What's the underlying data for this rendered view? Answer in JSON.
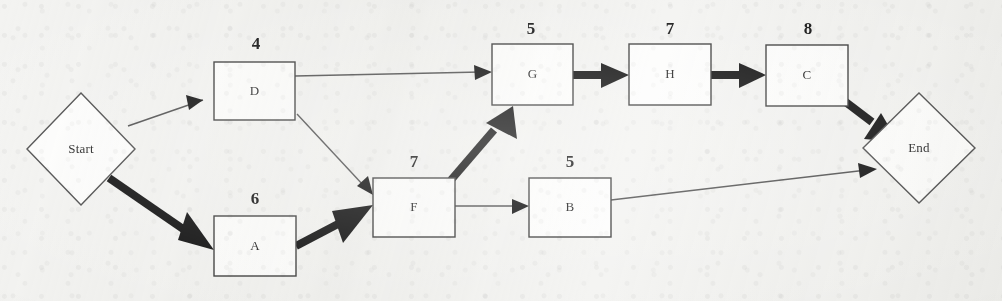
{
  "diagram": {
    "type": "activity-on-node-network",
    "background_color": "#f3f3f1",
    "line_color": "#4d4d4d",
    "critical_color": "#0d0d0d",
    "node_fill": "#fdfdfc"
  },
  "nodes": [
    {
      "id": "start",
      "label": "Start",
      "shape": "diamond",
      "weight": "",
      "cx": 81,
      "cy": 149,
      "rx": 54,
      "ry": 56
    },
    {
      "id": "d",
      "label": "D",
      "shape": "rect",
      "weight": "4",
      "x": 214,
      "y": 62,
      "w": 81,
      "h": 58
    },
    {
      "id": "a",
      "label": "A",
      "shape": "rect",
      "weight": "6",
      "x": 214,
      "y": 216,
      "w": 82,
      "h": 60
    },
    {
      "id": "f",
      "label": "F",
      "shape": "rect",
      "weight": "7",
      "x": 373,
      "y": 178,
      "w": 82,
      "h": 59
    },
    {
      "id": "g",
      "label": "G",
      "shape": "rect",
      "weight": "5",
      "x": 492,
      "y": 44,
      "w": 81,
      "h": 61
    },
    {
      "id": "b",
      "label": "B",
      "shape": "rect",
      "weight": "5",
      "x": 529,
      "y": 178,
      "w": 82,
      "h": 59
    },
    {
      "id": "h",
      "label": "H",
      "shape": "rect",
      "weight": "7",
      "x": 629,
      "y": 44,
      "w": 82,
      "h": 61
    },
    {
      "id": "c",
      "label": "C",
      "shape": "rect",
      "weight": "8",
      "x": 766,
      "y": 45,
      "w": 82,
      "h": 61
    },
    {
      "id": "end",
      "label": "End",
      "shape": "diamond",
      "weight": "",
      "cx": 919,
      "cy": 148,
      "rx": 56,
      "ry": 55
    }
  ],
  "edges": [
    {
      "from": "start",
      "to": "d",
      "critical": false
    },
    {
      "from": "start",
      "to": "a",
      "critical": true
    },
    {
      "from": "d",
      "to": "g",
      "critical": false
    },
    {
      "from": "d",
      "to": "f",
      "critical": false
    },
    {
      "from": "a",
      "to": "f",
      "critical": true
    },
    {
      "from": "f",
      "to": "g",
      "critical": true
    },
    {
      "from": "f",
      "to": "b",
      "critical": false
    },
    {
      "from": "g",
      "to": "h",
      "critical": true
    },
    {
      "from": "h",
      "to": "c",
      "critical": true
    },
    {
      "from": "c",
      "to": "end",
      "critical": true
    },
    {
      "from": "b",
      "to": "end",
      "critical": false
    }
  ]
}
